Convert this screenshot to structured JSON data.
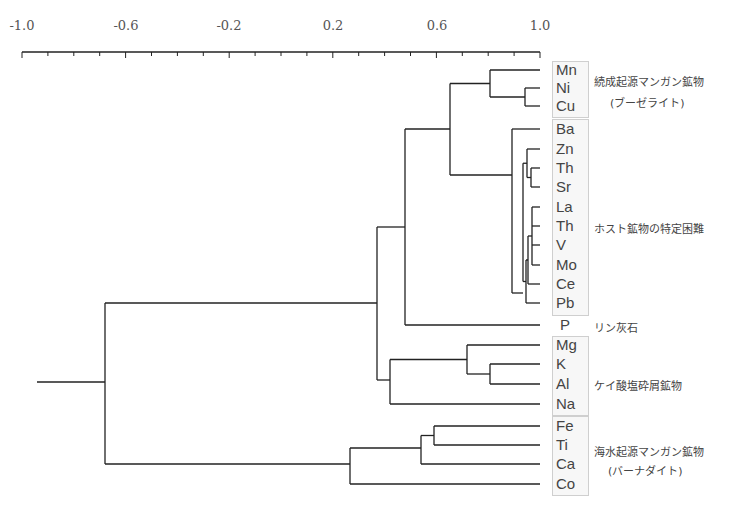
{
  "chart_data": {
    "type": "dendrogram",
    "title": "",
    "xlabel": "Correlation coefficient",
    "xlim": [
      -1.0,
      1.0
    ],
    "x_ticks": [
      "-1.0",
      "-0.6",
      "-0.2",
      "0.2",
      "0.6",
      "1.0"
    ],
    "leaves": [
      "Mn",
      "Ni",
      "Cu",
      "Ba",
      "Zn",
      "Th",
      "Sr",
      "La",
      "Th",
      "V",
      "Mo",
      "Ce",
      "Pb",
      "P",
      "Mg",
      "K",
      "Al",
      "Na",
      "Fe",
      "Ti",
      "Ca",
      "Co"
    ],
    "merges": [
      {
        "children": [
          "Ni",
          "Cu"
        ],
        "r": 0.95
      },
      {
        "children": [
          "Mn",
          "Ni-Cu"
        ],
        "r": 0.81
      },
      {
        "children": [
          "Th",
          "Sr"
        ],
        "r": 0.97
      },
      {
        "children": [
          "Zn",
          "Th-Sr"
        ],
        "r": 0.95
      },
      {
        "children": [
          "La",
          "Th",
          "V",
          "Mo"
        ],
        "r": 0.97
      },
      {
        "children": [
          "La-Mo",
          "Ce"
        ],
        "r": 0.95
      },
      {
        "children": [
          "La-Ce",
          "Pb"
        ],
        "r": 0.94
      },
      {
        "children": [
          "Zn-Sr",
          "La-Pb"
        ],
        "r": 0.93
      },
      {
        "children": [
          "Ba",
          "Zn-Pb"
        ],
        "r": 0.89
      },
      {
        "children": [
          "Mn-Cu",
          "Ba-Pb"
        ],
        "r": 0.65
      },
      {
        "children": [
          "Mn-Pb",
          "P"
        ],
        "r": 0.48
      },
      {
        "children": [
          "K",
          "Al"
        ],
        "r": 0.81
      },
      {
        "children": [
          "Mg",
          "K-Al"
        ],
        "r": 0.72
      },
      {
        "children": [
          "Mg-Al",
          "Na"
        ],
        "r": 0.42
      },
      {
        "children": [
          "Mn-P",
          "Mg-Na"
        ],
        "r": 0.37
      },
      {
        "children": [
          "Fe",
          "Ti"
        ],
        "r": 0.59
      },
      {
        "children": [
          "Fe-Ti",
          "Ca"
        ],
        "r": 0.54
      },
      {
        "children": [
          "Fe-Ca",
          "Co"
        ],
        "r": 0.27
      },
      {
        "children": [
          "Mn-Na",
          "Fe-Co"
        ],
        "r": -0.68
      }
    ],
    "groups": [
      {
        "label": "続成起源マンガン鉱物",
        "sublabel": "(ブーゼライト)",
        "members": [
          "Mn",
          "Ni",
          "Cu"
        ]
      },
      {
        "label": "ホスト鉱物の特定困難",
        "members": [
          "Ba",
          "Zn",
          "Th",
          "Sr",
          "La",
          "Th",
          "V",
          "Mo",
          "Ce",
          "Pb"
        ]
      },
      {
        "label": "リン灰石",
        "members": [
          "P"
        ]
      },
      {
        "label": "ケイ酸塩砕屑鉱物",
        "members": [
          "Mg",
          "K",
          "Al",
          "Na"
        ]
      },
      {
        "label": "海水起源マンガン鉱物",
        "sublabel": "(バーナダイト)",
        "members": [
          "Fe",
          "Ti",
          "Ca",
          "Co"
        ]
      }
    ],
    "grid": false
  },
  "axis": {
    "ticks": [
      {
        "label": "-1.0",
        "x": 22
      },
      {
        "label": "-0.6",
        "x": 126
      },
      {
        "label": "-0.2",
        "x": 229
      },
      {
        "label": "0.2",
        "x": 333
      },
      {
        "label": "0.6",
        "x": 437
      },
      {
        "label": "1.0",
        "x": 540
      }
    ]
  },
  "leaves": [
    {
      "label": "Mn",
      "y": 70
    },
    {
      "label": "Ni",
      "y": 88
    },
    {
      "label": "Cu",
      "y": 106
    },
    {
      "label": "Ba",
      "y": 129
    },
    {
      "label": "Zn",
      "y": 149
    },
    {
      "label": "Th",
      "y": 168
    },
    {
      "label": "Sr",
      "y": 187
    },
    {
      "label": "La",
      "y": 207
    },
    {
      "label": "Th",
      "y": 226
    },
    {
      "label": "V",
      "y": 245
    },
    {
      "label": "Mo",
      "y": 265
    },
    {
      "label": "Ce",
      "y": 284
    },
    {
      "label": "Pb",
      "y": 303
    },
    {
      "label": "P",
      "y": 325
    },
    {
      "label": "Mg",
      "y": 345
    },
    {
      "label": "K",
      "y": 364
    },
    {
      "label": "Al",
      "y": 384
    },
    {
      "label": "Na",
      "y": 404
    },
    {
      "label": "Fe",
      "y": 426
    },
    {
      "label": "Ti",
      "y": 445
    },
    {
      "label": "Ca",
      "y": 464
    },
    {
      "label": "Co",
      "y": 484
    }
  ],
  "groups": {
    "diagenetic": {
      "label": "続成起源マンガン鉱物",
      "sublabel": "(ブーゼライト)"
    },
    "unknown_host": {
      "label": "ホスト鉱物の特定困難"
    },
    "apatite": {
      "label": "リン灰石"
    },
    "silicate": {
      "label": "ケイ酸塩砕屑鉱物"
    },
    "hydrogenetic": {
      "label": "海水起源マンガン鉱物",
      "sublabel": "(バーナダイト)"
    }
  },
  "colors": {
    "line": "#222222",
    "box_border": "#cfcfcf",
    "box_fill": "#f7f7f7"
  }
}
